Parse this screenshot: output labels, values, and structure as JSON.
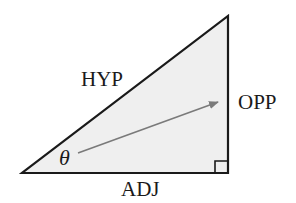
{
  "diagram": {
    "type": "right-triangle",
    "labels": {
      "hypotenuse": "HYP",
      "opposite": "OPP",
      "adjacent": "ADJ",
      "angle": "θ"
    },
    "colors": {
      "fill": "#efefef",
      "stroke": "#1a1a1a",
      "arrow": "#7a7a7a",
      "text": "#1a1a1a"
    },
    "vertices": {
      "angle_vertex": [
        22,
        173
      ],
      "right_angle_vertex": [
        228,
        173
      ],
      "apex": [
        228,
        16
      ]
    },
    "arrow": {
      "from": [
        78,
        153
      ],
      "to": [
        218,
        102
      ]
    }
  }
}
